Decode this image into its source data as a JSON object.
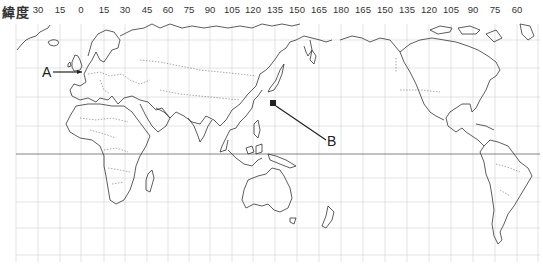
{
  "header": {
    "title": "緯度",
    "longitude_ticks": [
      "30",
      "15",
      "0",
      "15",
      "30",
      "45",
      "60",
      "75",
      "90",
      "105",
      "120",
      "135",
      "150",
      "165",
      "180",
      "165",
      "150",
      "135",
      "120",
      "105",
      "90",
      "75",
      "60"
    ]
  },
  "markers": {
    "a": {
      "label": "A",
      "target": "United Kingdom / London"
    },
    "b": {
      "label": "B",
      "target": "Japan / Tokyo"
    }
  },
  "map": {
    "projection": "Pacific-centered world map",
    "grid_spacing_degrees": 15,
    "line_color": "#333333",
    "grid_color": "#cccccc"
  }
}
